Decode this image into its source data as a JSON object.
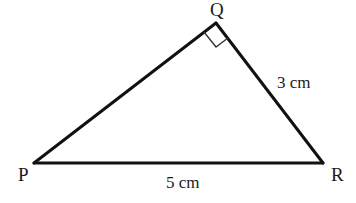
{
  "diagram": {
    "type": "right-triangle",
    "stroke_color": "#111111",
    "vertices": {
      "P": {
        "label": "P",
        "x": 34,
        "y": 163
      },
      "Q": {
        "label": "Q",
        "x": 216,
        "y": 23
      },
      "R": {
        "label": "R",
        "x": 323,
        "y": 163
      }
    },
    "right_angle_at": "Q",
    "sides": {
      "QR": {
        "label": "3 cm"
      },
      "PR": {
        "label": "5 cm"
      }
    }
  }
}
